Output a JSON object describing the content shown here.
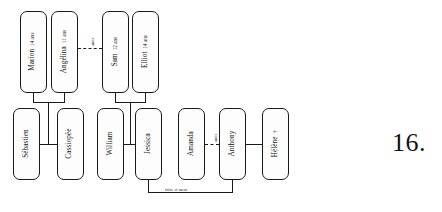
{
  "figure": {
    "number_label": "16.",
    "kind": "genogram",
    "language": "fr"
  },
  "colors": {
    "stroke": "#1a1a1a",
    "box_fill": "#fdfdfd",
    "page_background": "#ffffff",
    "text": "#111111"
  },
  "legend_symbols": {
    "deceased": "†"
  },
  "people": [
    {
      "id": "marion",
      "name": "Marion",
      "age": "14 ans",
      "generation": "children",
      "deceased": false
    },
    {
      "id": "angelina",
      "name": "Angélina",
      "age": "11 ans",
      "generation": "children",
      "deceased": false
    },
    {
      "id": "sam",
      "name": "Sam",
      "age": "12 ans",
      "generation": "children",
      "deceased": false
    },
    {
      "id": "elliot",
      "name": "Elliot",
      "age": "14 ans",
      "generation": "children",
      "deceased": false
    },
    {
      "id": "sebastien",
      "name": "Sébastien",
      "age": "",
      "generation": "parents",
      "deceased": false
    },
    {
      "id": "cassiopee",
      "name": "Cassiopée",
      "age": "",
      "generation": "parents",
      "deceased": false
    },
    {
      "id": "william",
      "name": "William",
      "age": "",
      "generation": "parents",
      "deceased": false
    },
    {
      "id": "jessica",
      "name": "Jessica",
      "age": "",
      "generation": "parents",
      "deceased": false
    },
    {
      "id": "amanda",
      "name": "Amanda",
      "age": "",
      "generation": "parents",
      "deceased": false
    },
    {
      "id": "anthony",
      "name": "Anthony",
      "age": "",
      "generation": "parents",
      "deceased": false
    },
    {
      "id": "helene",
      "name": "Hélène",
      "age": "",
      "generation": "parents",
      "deceased": true,
      "marker": "†"
    }
  ],
  "relations": [
    {
      "id": "rel-marion-angelina-parents",
      "type": "filiation",
      "style": "solid",
      "label": "",
      "from": [
        "sebastien",
        "cassiopee"
      ],
      "to": [
        "marion",
        "angelina"
      ]
    },
    {
      "id": "rel-sam-elliot-parents",
      "type": "filiation",
      "style": "solid",
      "label": "",
      "from": [
        "william",
        "jessica"
      ],
      "to": [
        "sam",
        "elliot"
      ]
    },
    {
      "id": "rel-sebastien-cassiopee",
      "type": "couple",
      "style": "solid",
      "label": "",
      "from": [
        "sebastien"
      ],
      "to": [
        "cassiopee"
      ]
    },
    {
      "id": "rel-william-jessica",
      "type": "couple",
      "style": "solid",
      "label": "",
      "from": [
        "william"
      ],
      "to": [
        "jessica"
      ]
    },
    {
      "id": "rel-anthony-helene",
      "type": "couple",
      "style": "solid",
      "label": "",
      "from": [
        "anthony"
      ],
      "to": [
        "helene"
      ]
    },
    {
      "id": "rel-angelina-sam",
      "type": "friendship",
      "style": "dashed",
      "label": "amis",
      "from": [
        "angelina"
      ],
      "to": [
        "sam"
      ]
    },
    {
      "id": "rel-amanda-anthony",
      "type": "friendship",
      "style": "dashed",
      "label": "amis",
      "from": [
        "amanda"
      ],
      "to": [
        "anthony"
      ]
    },
    {
      "id": "rel-jessica-anthony",
      "type": "sibling",
      "style": "solid",
      "label": "frère et sœur",
      "from": [
        "jessica"
      ],
      "to": [
        "anthony"
      ]
    }
  ],
  "edge_labels": {
    "amis_top": "amis",
    "amis_right": "amis",
    "siblings": "frère et sœur"
  }
}
